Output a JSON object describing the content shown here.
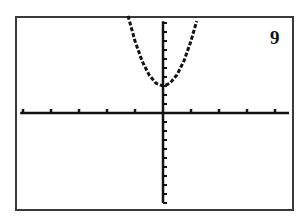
{
  "figure": {
    "label": "9",
    "frame_color": "#3a3a3a",
    "axis_color": "#111111",
    "curve_color": "#111111"
  },
  "chart_data": {
    "type": "line",
    "title": "",
    "panel_label": "9",
    "xlabel": "",
    "ylabel": "",
    "x_tick_spacing": 1,
    "y_tick_spacing": 1,
    "xlim": [
      -5.1,
      4.5
    ],
    "ylim": [
      -10,
      10.2
    ],
    "grid": false,
    "legend": null,
    "axes_through_origin": true,
    "series": [
      {
        "name": "y = 5x^2 + 3 (approx.)",
        "style": "dashed-pixel",
        "x": [
          -1.25,
          -1.0,
          -0.75,
          -0.5,
          -0.25,
          0,
          0.25,
          0.5,
          0.75,
          1.0,
          1.2
        ],
        "y": [
          10.8,
          8.0,
          5.8,
          4.25,
          3.3,
          3.0,
          3.3,
          4.25,
          5.8,
          8.0,
          10.2
        ]
      }
    ],
    "vertex": [
      0,
      3
    ],
    "pixel_mapping": {
      "origin_px": [
        163,
        113
      ],
      "x_px_per_unit": 28,
      "y_px_per_unit": 9
    }
  }
}
